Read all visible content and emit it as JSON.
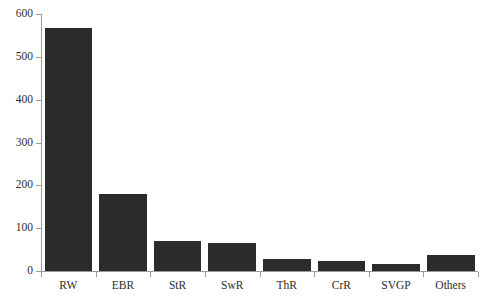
{
  "chart_data": {
    "type": "bar",
    "title": "",
    "subtitle": "",
    "xlabel": "",
    "ylabel": "",
    "categories": [
      "RW",
      "EBR",
      "StR",
      "SwR",
      "ThR",
      "CrR",
      "SVGP",
      "Others"
    ],
    "values": [
      568,
      180,
      70,
      65,
      28,
      23,
      16,
      37
    ],
    "ylim": [
      0,
      600
    ],
    "yticks": [
      0,
      100,
      200,
      300,
      400,
      500,
      600
    ],
    "ytick_labels": [
      "0",
      "100",
      "200",
      "300",
      "400",
      "500",
      "600"
    ],
    "grid": false,
    "legend": null,
    "bar_color": "#2b2b2b",
    "axis_color": "#9a9a9a",
    "text_color": "#2e2e2e",
    "background": "#ffffff"
  }
}
